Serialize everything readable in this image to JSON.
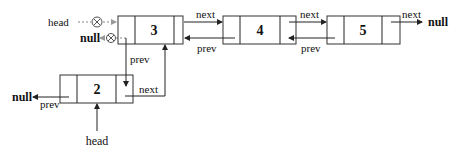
{
  "diagram": {
    "type": "doubly-linked-list-insertion",
    "nodes": [
      {
        "id": "node-2",
        "value": "2"
      },
      {
        "id": "node-3",
        "value": "3"
      },
      {
        "id": "node-4",
        "value": "4"
      },
      {
        "id": "node-5",
        "value": "5"
      }
    ],
    "labels": {
      "next": "next",
      "prev": "prev",
      "null": "null",
      "head": "head"
    },
    "old_head_label": "head",
    "old_null_label": "null",
    "new_head_label": "head",
    "tail_null_label": "null",
    "new_null_label": "null",
    "edges": [
      {
        "from": "node-3",
        "to": "node-4",
        "label": "next"
      },
      {
        "from": "node-4",
        "to": "node-3",
        "label": "prev"
      },
      {
        "from": "node-4",
        "to": "node-5",
        "label": "next"
      },
      {
        "from": "node-5",
        "to": "node-4",
        "label": "prev"
      },
      {
        "from": "node-5",
        "to": "null",
        "label": "next"
      },
      {
        "from": "node-2",
        "to": "node-3",
        "label": "next"
      },
      {
        "from": "node-3",
        "to": "node-2",
        "label": "prev"
      },
      {
        "from": "node-2",
        "to": "null",
        "label": "prev"
      }
    ]
  }
}
